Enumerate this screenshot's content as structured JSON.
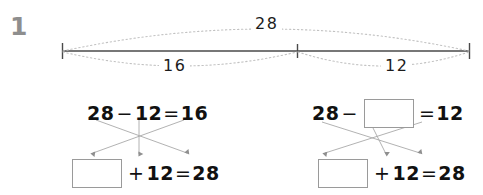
{
  "problem": {
    "number": "1"
  },
  "number_line": {
    "total_label": "28",
    "left_part_label": "16",
    "right_part_label": "12",
    "tick_count": 3,
    "line_color": "#4a4a4a",
    "arc_color": "#bdbdbd"
  },
  "equations": {
    "left_group": {
      "top": {
        "minuend": "28",
        "minus_sign": "−",
        "subtrahend": "12",
        "equals_sign": "=",
        "difference": "16"
      },
      "bottom": {
        "addend_box": "",
        "plus_sign": "+",
        "addend": "12",
        "equals_sign": "=",
        "sum": "28"
      }
    },
    "right_group": {
      "top": {
        "minuend": "28",
        "minus_sign": "−",
        "subtrahend_box": "",
        "equals_sign": "=",
        "difference": "12"
      },
      "bottom": {
        "addend_box": "",
        "plus_sign": "+",
        "addend": "12",
        "equals_sign": "=",
        "sum": "28"
      }
    }
  },
  "colors": {
    "background": "#ffffff",
    "text": "#111111",
    "number_gray": "#8e8e8e",
    "box_border": "#9a9a9a",
    "arrow": "#909090"
  }
}
